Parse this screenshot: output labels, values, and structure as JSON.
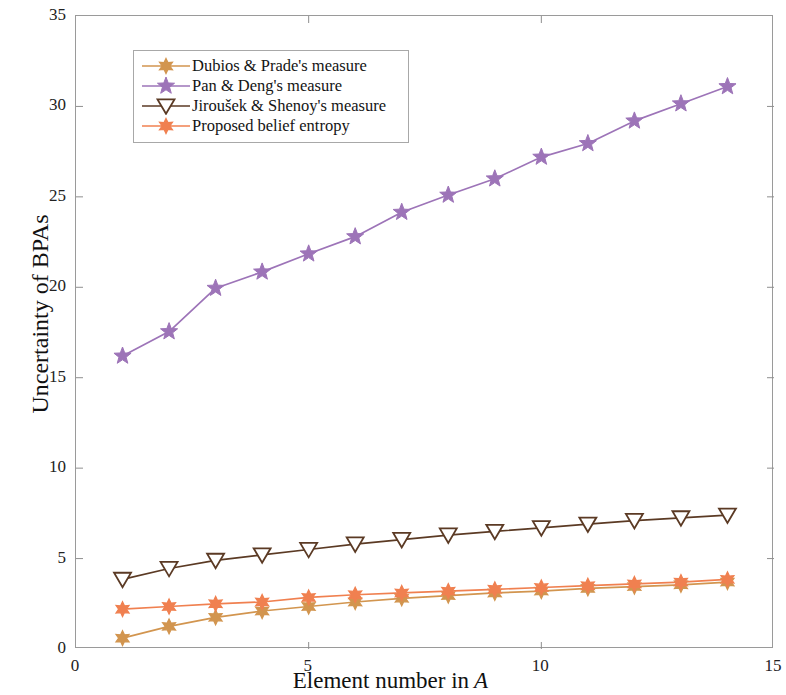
{
  "chart_data": {
    "type": "line",
    "title": "",
    "xlabel": "Element number in A",
    "xlabel_plain": "Element number in",
    "xlabel_variable": "A",
    "ylabel": "Uncertainty of BPAs",
    "xlim": [
      0,
      15
    ],
    "ylim": [
      0,
      35
    ],
    "xticks": [
      0,
      5,
      10,
      15
    ],
    "xtick_labels": [
      "0",
      "5",
      "10",
      "15"
    ],
    "yticks": [
      0,
      5,
      10,
      15,
      20,
      25,
      30,
      35
    ],
    "ytick_labels": [
      "0",
      "5",
      "10",
      "15",
      "20",
      "25",
      "30",
      "35"
    ],
    "grid": false,
    "legend_position": "upper left (inside axes)",
    "x": [
      1,
      2,
      3,
      4,
      5,
      6,
      7,
      8,
      9,
      10,
      11,
      12,
      13,
      14
    ],
    "series": [
      {
        "name": "Dubios & Prade's measure",
        "color": "#d2954f",
        "marker": "hexagram",
        "values": [
          0.6,
          1.25,
          1.75,
          2.1,
          2.35,
          2.6,
          2.8,
          2.95,
          3.1,
          3.2,
          3.35,
          3.45,
          3.55,
          3.7
        ]
      },
      {
        "name": "Pan & Deng's measure",
        "color": "#9d74b8",
        "marker": "pentagram",
        "values": [
          16.2,
          17.55,
          19.95,
          20.85,
          21.85,
          22.8,
          24.15,
          25.1,
          26.0,
          27.2,
          27.95,
          29.2,
          30.15,
          31.1
        ]
      },
      {
        "name": "Jiroušek & Shenoy's measure",
        "color": "#5b3a24",
        "marker": "triangle-down",
        "values": [
          3.85,
          4.45,
          4.9,
          5.2,
          5.5,
          5.8,
          6.05,
          6.3,
          6.5,
          6.7,
          6.9,
          7.1,
          7.25,
          7.4
        ]
      },
      {
        "name": "Proposed belief entropy",
        "color": "#f08050",
        "marker": "hexagram",
        "values": [
          2.2,
          2.35,
          2.5,
          2.6,
          2.85,
          3.0,
          3.1,
          3.2,
          3.3,
          3.4,
          3.5,
          3.6,
          3.7,
          3.85
        ]
      }
    ]
  },
  "legend": {
    "items": [
      {
        "label": "Dubios & Prade's measure",
        "color": "#d2954f",
        "marker": "hexagram"
      },
      {
        "label": "Pan & Deng's measure",
        "color": "#9d74b8",
        "marker": "pentagram"
      },
      {
        "label": "Jiroušek & Shenoy's measure",
        "color": "#5b3a24",
        "marker": "triangle-down"
      },
      {
        "label": "Proposed belief entropy",
        "color": "#f08050",
        "marker": "hexagram"
      }
    ]
  },
  "axes": {
    "y_title": "Uncertainty of BPAs",
    "x_title_plain": "Element number in",
    "x_title_variable": "A"
  }
}
